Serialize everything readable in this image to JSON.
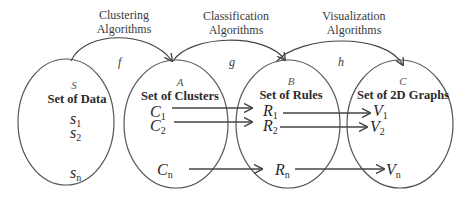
{
  "algorithms": {
    "clustering": {
      "line1": "Clustering",
      "line2": "Algorithms",
      "function": "f"
    },
    "classification": {
      "line1": "Classification",
      "line2": "Algorithms",
      "function": "g"
    },
    "visualization": {
      "line1": "Visualization",
      "line2": "Algorithms",
      "function": "h"
    }
  },
  "sets": [
    {
      "letter": "S",
      "title": "Set of Data",
      "elements": [
        {
          "base": "s",
          "sub": "1"
        },
        {
          "base": "s",
          "sub": "2"
        },
        {
          "base": "s",
          "sub": "n"
        }
      ]
    },
    {
      "letter": "A",
      "title": "Set of Clusters",
      "elements": [
        {
          "base": "C",
          "sub": "1"
        },
        {
          "base": "C",
          "sub": "2"
        },
        {
          "base": "C",
          "sub": "n"
        }
      ]
    },
    {
      "letter": "B",
      "title": "Set of Rules",
      "elements": [
        {
          "base": "R",
          "sub": "1"
        },
        {
          "base": "R",
          "sub": "2"
        },
        {
          "base": "R",
          "sub": "n"
        }
      ]
    },
    {
      "letter": "C",
      "title": "Set of 2D Graphs",
      "elements": [
        {
          "base": "V",
          "sub": "1"
        },
        {
          "base": "V",
          "sub": "2"
        },
        {
          "base": "V",
          "sub": "n"
        }
      ]
    }
  ],
  "colors": {
    "stroke": "#444444",
    "text": "#2a2a2a",
    "background": "#ffffff"
  }
}
